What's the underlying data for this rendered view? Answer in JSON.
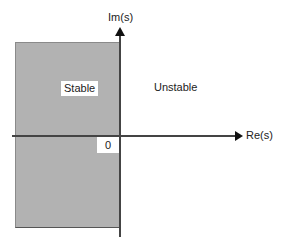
{
  "diagram": {
    "axes": {
      "horizontal_label": "Re(s)",
      "vertical_label": "Im(s)",
      "origin_label": "0"
    },
    "regions": {
      "left_half": {
        "label": "Stable",
        "fill": "#b2b2b2"
      },
      "right_half": {
        "label": "Unstable",
        "fill": "#ffffff"
      }
    }
  }
}
